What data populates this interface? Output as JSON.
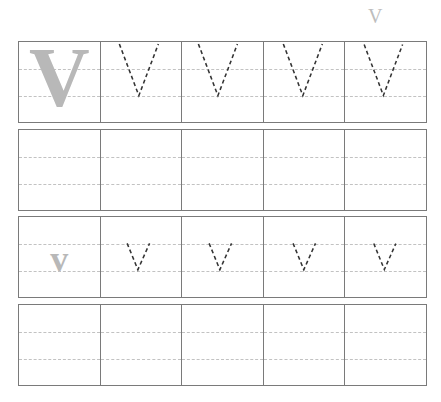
{
  "worksheet": {
    "letter": "V",
    "corner_label": "V",
    "rows": [
      {
        "type": "uppercase-trace",
        "model": "V",
        "trace_cells": 4
      },
      {
        "type": "blank-practice",
        "cells": 5
      },
      {
        "type": "lowercase-trace",
        "model": "v",
        "trace_cells": 4
      },
      {
        "type": "blank-practice",
        "cells": 5
      }
    ],
    "colors": {
      "border": "#7a7a7a",
      "guide": "#c2c2c2",
      "model_letter": "#b8b8b8",
      "trace": "#333333"
    }
  }
}
